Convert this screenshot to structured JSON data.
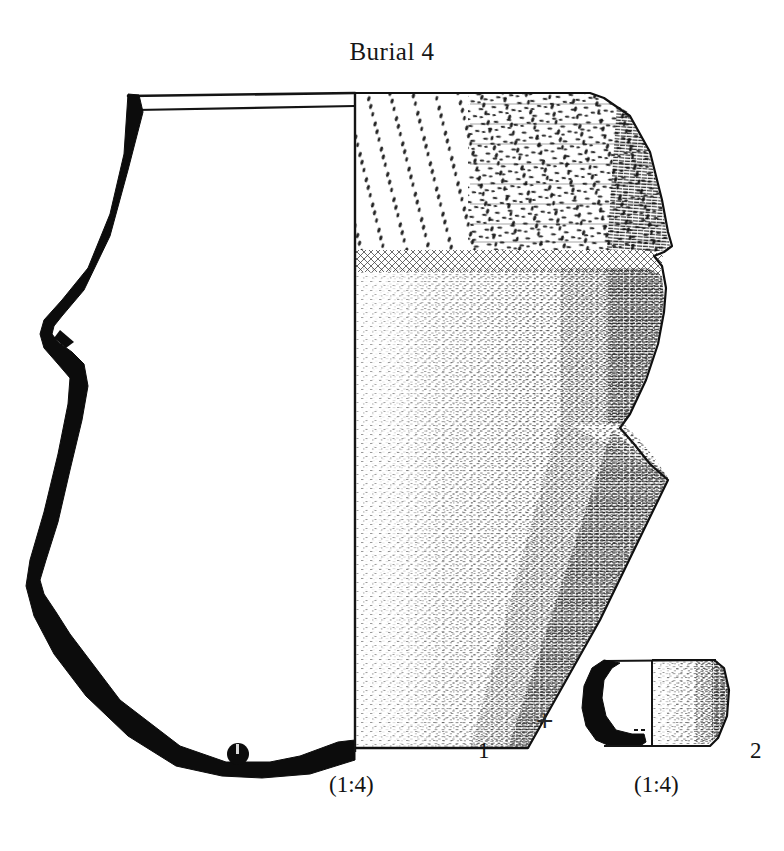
{
  "figure": {
    "title": "Burial 4",
    "domain_kind": "archaeological-pottery-plate",
    "background_color": "#ffffff",
    "ink_color": "#111111"
  },
  "objects": [
    {
      "number_label": "1",
      "scale_label": "(1:4)",
      "name": "large-carinated-jar",
      "description_visible": "section-and-exterior pottery profile drawing"
    },
    {
      "number_label": "2",
      "scale_label": "(1:4)",
      "name": "small-bowl",
      "description_visible": "section-and-exterior pottery profile drawing"
    }
  ],
  "connector": {
    "symbol": "+"
  },
  "icons": {
    "plus": "plus-icon",
    "findspot_dot": "filled-dot-marker"
  }
}
